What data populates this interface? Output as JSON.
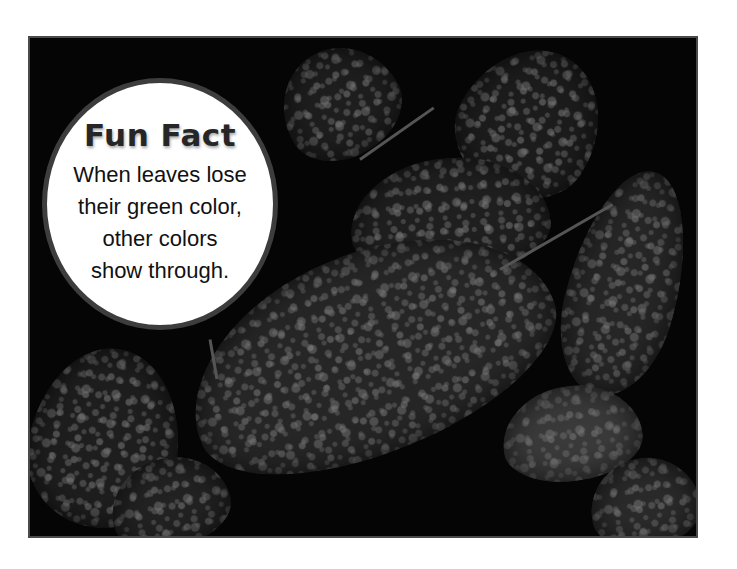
{
  "page": {
    "background_color": "#ffffff"
  },
  "photo": {
    "subject": "dark leaves covered with water droplets",
    "tone": "grayscale",
    "border_color": "#4a4a4a"
  },
  "fun_fact": {
    "title": "Fun Fact",
    "lines": [
      "When leaves lose",
      "their green color,",
      "other colors",
      "show through."
    ],
    "ring_color": "#3d3d3d",
    "fill_color": "#ffffff"
  }
}
